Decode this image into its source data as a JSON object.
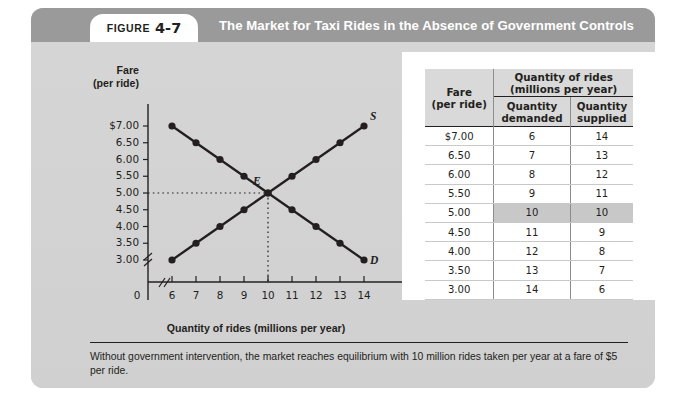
{
  "figure": {
    "word": "Figure",
    "number": "4-7",
    "title": "The Market for Taxi Rides in the Absence of Government Controls"
  },
  "chart_data": {
    "type": "line",
    "title": "The Market for Taxi Rides in the Absence of Government Controls",
    "xlabel": "Quantity of rides (millions per year)",
    "ylabel": "Fare (per ride)",
    "ylabel_line1": "Fare",
    "ylabel_line2": "(per ride)",
    "x": [
      6,
      7,
      8,
      9,
      10,
      11,
      12,
      13,
      14
    ],
    "xlim": [
      6,
      14
    ],
    "ylim": [
      3.0,
      7.0
    ],
    "origin_label": "0",
    "axis_break_x": true,
    "axis_break_y": true,
    "grid": false,
    "xticks": [
      "6",
      "7",
      "8",
      "9",
      "10",
      "11",
      "12",
      "13",
      "14"
    ],
    "yticks": [
      "$7.00",
      "6.50",
      "6.00",
      "5.50",
      "5.00",
      "4.50",
      "4.00",
      "3.50",
      "3.00"
    ],
    "ytick_values": [
      7.0,
      6.5,
      6.0,
      5.5,
      5.0,
      4.5,
      4.0,
      3.5,
      3.0
    ],
    "series": [
      {
        "name": "Demand",
        "label": "D",
        "values": [
          7.0,
          6.5,
          6.0,
          5.5,
          5.0,
          4.5,
          4.0,
          3.5,
          3.0
        ]
      },
      {
        "name": "Supply",
        "label": "S",
        "values": [
          3.0,
          3.5,
          4.0,
          4.5,
          5.0,
          5.5,
          6.0,
          6.5,
          7.0
        ]
      }
    ],
    "annotations": [
      {
        "label": "E",
        "x": 10,
        "y": 5.0,
        "note": "equilibrium point"
      }
    ],
    "legend_position": "inline-curve-ends"
  },
  "table": {
    "group_header_line1": "Quantity of rides",
    "group_header_line2": "(millions per year)",
    "col_fare_line1": "Fare",
    "col_fare_line2": "(per ride)",
    "col_demanded_line1": "Quantity",
    "col_demanded_line2": "demanded",
    "col_supplied_line1": "Quantity",
    "col_supplied_line2": "supplied",
    "highlight_color": "#c8c8c8",
    "rows": [
      {
        "fare": "$7.00",
        "demanded": "6",
        "supplied": "14",
        "highlight": false
      },
      {
        "fare": "6.50",
        "demanded": "7",
        "supplied": "13",
        "highlight": false
      },
      {
        "fare": "6.00",
        "demanded": "8",
        "supplied": "12",
        "highlight": false
      },
      {
        "fare": "5.50",
        "demanded": "9",
        "supplied": "11",
        "highlight": false
      },
      {
        "fare": "5.00",
        "demanded": "10",
        "supplied": "10",
        "highlight": true
      },
      {
        "fare": "4.50",
        "demanded": "11",
        "supplied": "9",
        "highlight": false
      },
      {
        "fare": "4.00",
        "demanded": "12",
        "supplied": "8",
        "highlight": false
      },
      {
        "fare": "3.50",
        "demanded": "13",
        "supplied": "7",
        "highlight": false
      },
      {
        "fare": "3.00",
        "demanded": "14",
        "supplied": "6",
        "highlight": false
      }
    ]
  },
  "caption": {
    "text": "Without government intervention, the market reaches equilibrium with 10 million rides taken per year at a fare of $5 per ride."
  }
}
